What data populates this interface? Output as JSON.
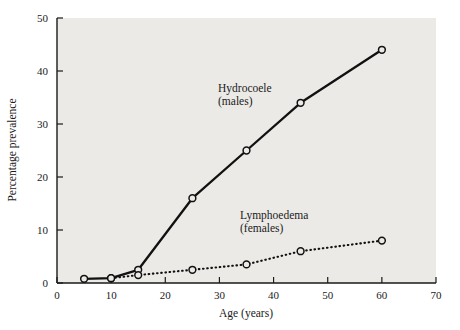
{
  "chart_data": {
    "type": "line",
    "title": "",
    "xlabel": "Age (years)",
    "ylabel": "Percentage prevalence",
    "xlim": [
      0,
      70
    ],
    "ylim": [
      0,
      50
    ],
    "xticks": [
      0,
      10,
      20,
      30,
      40,
      50,
      60,
      70
    ],
    "yticks": [
      0,
      10,
      20,
      30,
      40,
      50
    ],
    "xtick_labels": [
      "0",
      "10",
      "20",
      "30",
      "40",
      "50",
      "60",
      "70"
    ],
    "ytick_labels": [
      "0",
      "10",
      "20",
      "30",
      "40",
      "50"
    ],
    "grid": false,
    "legend_position": "inline-annotation",
    "plot_background": "#eceae7",
    "series": [
      {
        "name": "Hydrocoele (males)",
        "label_line1": "Hydrocoele",
        "label_line2": "(males)",
        "style": "solid",
        "color": "#111111",
        "marker": "open-circle",
        "x": [
          5,
          10,
          15,
          25,
          35,
          45,
          60
        ],
        "values": [
          0.8,
          0.9,
          2.5,
          16,
          25,
          34,
          44
        ]
      },
      {
        "name": "Lymphoedema (females)",
        "label_line1": "Lymphoedema",
        "label_line2": "(females)",
        "style": "dotted",
        "color": "#111111",
        "marker": "open-circle",
        "x": [
          10,
          15,
          25,
          35,
          45,
          60
        ],
        "values": [
          0.9,
          1.5,
          2.5,
          3.5,
          6,
          8
        ]
      }
    ]
  }
}
